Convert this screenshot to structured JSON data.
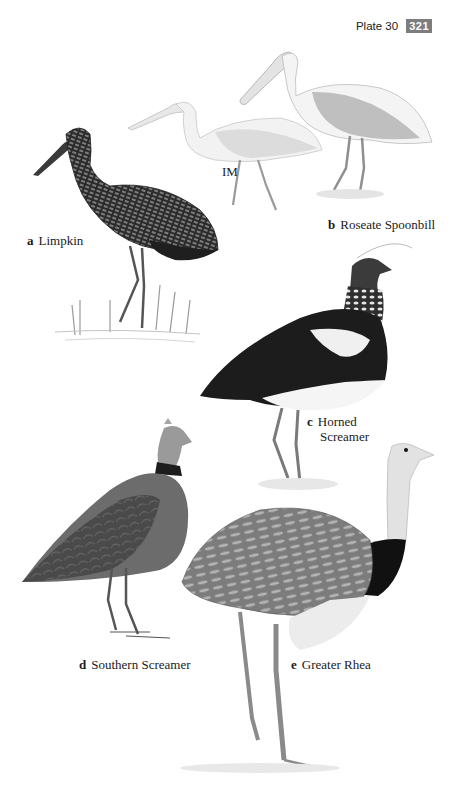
{
  "header": {
    "plate_label": "Plate 30",
    "page_number": "321",
    "badge_color": "#7d7d7d"
  },
  "species": [
    {
      "letter": "a",
      "name": "Limpkin"
    },
    {
      "letter": "b",
      "name": "Roseate Spoonbill",
      "variant_label": "IM"
    },
    {
      "letter": "c",
      "name_line1": "Horned",
      "name_line2": "Screamer"
    },
    {
      "letter": "d",
      "name": "Southern Screamer"
    },
    {
      "letter": "e",
      "name": "Greater Rhea"
    }
  ]
}
